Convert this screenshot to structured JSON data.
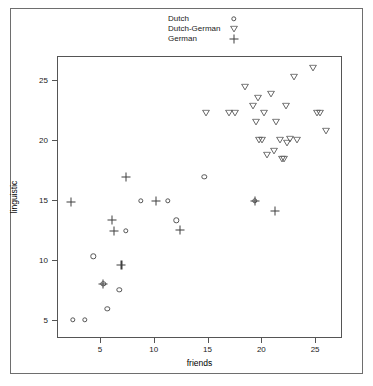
{
  "chart_data": {
    "type": "scatter",
    "title": "",
    "xlabel": "friends",
    "ylabel": "linguistic",
    "xlim": [
      1,
      27.5
    ],
    "ylim": [
      3.5,
      27
    ],
    "grid": false,
    "legend_position": "top-center-inside",
    "xticks": [
      5,
      10,
      15,
      20,
      25
    ],
    "yticks": [
      5,
      10,
      15,
      20,
      25
    ],
    "series": [
      {
        "name": "Dutch",
        "marker": "circle-open",
        "points": [
          [
            2.4,
            5.1
          ],
          [
            3.5,
            5.1
          ],
          [
            4.3,
            10.4
          ],
          [
            5.2,
            8.1
          ],
          [
            5.6,
            6.0
          ],
          [
            6.7,
            7.6
          ],
          [
            7.3,
            12.5
          ],
          [
            8.7,
            15.0
          ],
          [
            11.2,
            15.0
          ],
          [
            12.0,
            13.4
          ],
          [
            14.6,
            17.0
          ],
          [
            19.3,
            15.0
          ]
        ]
      },
      {
        "name": "Dutch-German",
        "marker": "triangle-down-open",
        "points": [
          [
            14.8,
            22.3
          ],
          [
            16.9,
            22.3
          ],
          [
            17.5,
            22.3
          ],
          [
            18.4,
            24.5
          ],
          [
            19.1,
            22.9
          ],
          [
            19.4,
            21.6
          ],
          [
            19.6,
            23.6
          ],
          [
            19.7,
            20.1
          ],
          [
            20.0,
            20.1
          ],
          [
            20.2,
            22.3
          ],
          [
            20.4,
            18.8
          ],
          [
            20.8,
            23.9
          ],
          [
            21.1,
            19.2
          ],
          [
            21.3,
            21.6
          ],
          [
            21.6,
            20.1
          ],
          [
            21.8,
            18.5
          ],
          [
            22.0,
            18.5
          ],
          [
            22.2,
            22.9
          ],
          [
            22.3,
            19.8
          ],
          [
            22.6,
            20.2
          ],
          [
            22.9,
            25.3
          ],
          [
            23.2,
            20.1
          ],
          [
            24.7,
            26.1
          ],
          [
            25.1,
            22.3
          ],
          [
            25.4,
            22.3
          ],
          [
            25.9,
            20.8
          ]
        ]
      },
      {
        "name": "German",
        "marker": "plus",
        "points": [
          [
            2.2,
            14.9
          ],
          [
            5.2,
            8.1
          ],
          [
            6.0,
            13.4
          ],
          [
            6.2,
            12.5
          ],
          [
            6.9,
            9.7
          ],
          [
            7.3,
            17.0
          ],
          [
            10.1,
            15.0
          ],
          [
            12.3,
            12.6
          ],
          [
            19.3,
            15.0
          ],
          [
            21.2,
            14.2
          ]
        ]
      }
    ]
  },
  "legend": {
    "items": [
      {
        "label": "Dutch",
        "symbol": "circle-open-icon"
      },
      {
        "label": "Dutch-German",
        "symbol": "triangle-down-open-icon"
      },
      {
        "label": "German",
        "symbol": "plus-icon"
      }
    ]
  },
  "colors": {
    "marker": "#3a3a3a",
    "axis": "#555555",
    "text": "#1a1a1a",
    "background": "#ffffff"
  }
}
